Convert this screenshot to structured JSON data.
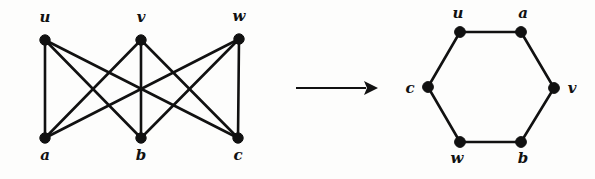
{
  "figure": {
    "colors": {
      "ink": "#111111",
      "background": "#fdfdfc"
    },
    "left_graph": {
      "name": "bipartite-graph-k33",
      "type": "complete-bipartite",
      "top_row": [
        {
          "id": "u",
          "label": "u",
          "x": 45,
          "y": 40,
          "label_x": 45,
          "label_y": 22
        },
        {
          "id": "v",
          "label": "v",
          "x": 141,
          "y": 40,
          "label_x": 141,
          "label_y": 22
        },
        {
          "id": "w",
          "label": "w",
          "x": 239,
          "y": 39,
          "label_x": 239,
          "label_y": 21
        }
      ],
      "bottom_row": [
        {
          "id": "a",
          "label": "a",
          "x": 45,
          "y": 138,
          "label_x": 45,
          "label_y": 160
        },
        {
          "id": "b",
          "label": "b",
          "x": 141,
          "y": 138,
          "label_x": 141,
          "label_y": 160
        },
        {
          "id": "c",
          "label": "c",
          "x": 238,
          "y": 138,
          "label_x": 238,
          "label_y": 160
        }
      ],
      "edges": [
        {
          "from": "u",
          "to": "a"
        },
        {
          "from": "u",
          "to": "b"
        },
        {
          "from": "u",
          "to": "c"
        },
        {
          "from": "v",
          "to": "a"
        },
        {
          "from": "v",
          "to": "b"
        },
        {
          "from": "v",
          "to": "c"
        },
        {
          "from": "w",
          "to": "a"
        },
        {
          "from": "w",
          "to": "b"
        },
        {
          "from": "w",
          "to": "c"
        }
      ],
      "node_radius": 5.2
    },
    "arrow": {
      "name": "transformation-arrow",
      "glyph": "right-arrow",
      "x1": 296,
      "y1": 88,
      "x2": 366,
      "y2": 88,
      "head_length": 12,
      "head_half_width": 7
    },
    "right_graph": {
      "name": "hexagon-cycle",
      "type": "cycle",
      "vertices": [
        {
          "id": "u",
          "label": "u",
          "x": 460,
          "y": 32,
          "label_x": 458,
          "label_y": 18
        },
        {
          "id": "a",
          "label": "a",
          "x": 521,
          "y": 32,
          "label_x": 523,
          "label_y": 18
        },
        {
          "id": "v",
          "label": "v",
          "x": 554,
          "y": 88,
          "label_x": 572,
          "label_y": 93
        },
        {
          "id": "b",
          "label": "b",
          "x": 521,
          "y": 142,
          "label_x": 523,
          "label_y": 163
        },
        {
          "id": "w",
          "label": "w",
          "x": 460,
          "y": 142,
          "label_x": 457,
          "label_y": 163
        },
        {
          "id": "c",
          "label": "c",
          "x": 428,
          "y": 87,
          "label_x": 410,
          "label_y": 93
        }
      ],
      "edges": [
        {
          "from": "u",
          "to": "a"
        },
        {
          "from": "a",
          "to": "v"
        },
        {
          "from": "v",
          "to": "b"
        },
        {
          "from": "b",
          "to": "w"
        },
        {
          "from": "w",
          "to": "c"
        },
        {
          "from": "c",
          "to": "u"
        }
      ],
      "node_radius": 5.4
    }
  }
}
